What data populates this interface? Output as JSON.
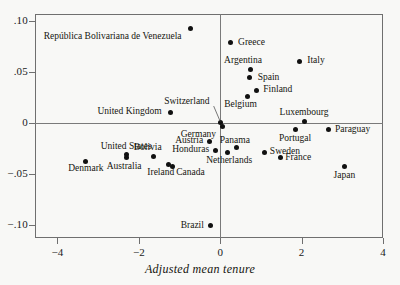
{
  "chart_data": {
    "type": "scatter",
    "title": "",
    "xlabel": "Adjusted mean tenure",
    "ylabel": "",
    "xlim": [
      -4.55,
      4.0
    ],
    "ylim": [
      -0.1125,
      0.1065
    ],
    "grid": false,
    "legend": null,
    "xticks": [
      -4,
      -2,
      0,
      2,
      4
    ],
    "xticklabels": [
      "−4",
      "−2",
      "0",
      "2",
      "4"
    ],
    "yticks": [
      0.1,
      0.05,
      0,
      -0.05,
      -0.1
    ],
    "yticklabels": [
      ".10",
      ".05",
      "0",
      "−.05",
      "−.10"
    ],
    "reference_lines": {
      "horizontal": 0,
      "vertical": 0
    },
    "point_color": "#111111",
    "frame_color": "#6f6f6f",
    "background": "#f8f8f6",
    "points": [
      {
        "label": "República Bolivariana de Venezuela",
        "x": -0.72,
        "y": 0.0925,
        "anchor": "end",
        "lx": -0.95,
        "ly": 0.0845
      },
      {
        "label": "Greece",
        "x": 0.26,
        "y": 0.0785,
        "anchor": "start",
        "lx": 0.44,
        "ly": 0.0785
      },
      {
        "label": "Italy",
        "x": 1.96,
        "y": 0.0605,
        "anchor": "start",
        "lx": 2.14,
        "ly": 0.0605
      },
      {
        "label": "Argentina",
        "x": 0.75,
        "y": 0.0525,
        "anchor": "mid",
        "lx": 0.56,
        "ly": 0.0605
      },
      {
        "label": "Spain",
        "x": 0.73,
        "y": 0.044,
        "anchor": "start",
        "lx": 0.92,
        "ly": 0.044
      },
      {
        "label": "Finland",
        "x": 0.88,
        "y": 0.032,
        "anchor": "start",
        "lx": 1.06,
        "ly": 0.032
      },
      {
        "label": "Belgium",
        "x": 0.66,
        "y": 0.0255,
        "anchor": "mid",
        "lx": 0.5,
        "ly": 0.0175
      },
      {
        "label": "Switzerland",
        "x": 0.01,
        "y": 0.0005,
        "anchor": "end",
        "lx": -0.26,
        "ly": 0.0205
      },
      {
        "label": "United Kingdom",
        "x": -1.23,
        "y": 0.0105,
        "anchor": "end",
        "lx": -1.44,
        "ly": 0.0105
      },
      {
        "label": "Luxembourg",
        "x": 2.06,
        "y": 0.001,
        "anchor": "mid",
        "lx": 2.06,
        "ly": 0.0095
      },
      {
        "label": "Paraguay",
        "x": 2.65,
        "y": -0.0065,
        "anchor": "start",
        "lx": 2.82,
        "ly": -0.0065
      },
      {
        "label": "Germany",
        "x": 0.05,
        "y": -0.0035,
        "anchor": "end",
        "lx": -0.1,
        "ly": -0.0115
      },
      {
        "label": "Portugal",
        "x": 1.84,
        "y": -0.0065,
        "anchor": "mid",
        "lx": 1.84,
        "ly": -0.0155
      },
      {
        "label": "Austria",
        "x": -0.27,
        "y": -0.018,
        "anchor": "end",
        "lx": -0.42,
        "ly": -0.018
      },
      {
        "label": "Bolivia",
        "x": -1.63,
        "y": -0.0325,
        "anchor": "mid",
        "lx": -1.78,
        "ly": -0.0245
      },
      {
        "label": "Panama",
        "x": 0.41,
        "y": -0.0245,
        "anchor": "mid",
        "lx": 0.36,
        "ly": -0.018
      },
      {
        "label": "Sweden",
        "x": 1.1,
        "y": -0.0285,
        "anchor": "start",
        "lx": 1.22,
        "ly": -0.0285
      },
      {
        "label": "United States",
        "x": -2.31,
        "y": -0.0305,
        "anchor": "mid",
        "lx": -2.31,
        "ly": -0.0235
      },
      {
        "label": "Honduras",
        "x": -0.12,
        "y": -0.0265,
        "anchor": "end",
        "lx": -0.27,
        "ly": -0.0265
      },
      {
        "label": "France",
        "x": 1.48,
        "y": -0.034,
        "anchor": "start",
        "lx": 1.6,
        "ly": -0.034
      },
      {
        "label": "Netherlands",
        "x": 0.17,
        "y": -0.029,
        "anchor": "mid",
        "lx": 0.22,
        "ly": -0.037
      },
      {
        "label": "Denmark",
        "x": -3.3,
        "y": -0.0375,
        "anchor": "mid",
        "lx": -3.3,
        "ly": -0.0455
      },
      {
        "label": "Australia",
        "x": -2.31,
        "y": -0.034,
        "anchor": "mid",
        "lx": -2.36,
        "ly": -0.043
      },
      {
        "label": "Ireland",
        "x": -1.28,
        "y": -0.0405,
        "anchor": "mid",
        "lx": -1.46,
        "ly": -0.049
      },
      {
        "label": "Canada",
        "x": -1.18,
        "y": -0.0425,
        "anchor": "start",
        "lx": -1.08,
        "ly": -0.049
      },
      {
        "label": "Japan",
        "x": 3.05,
        "y": -0.043,
        "anchor": "mid",
        "lx": 3.05,
        "ly": -0.052
      },
      {
        "label": "Brazil",
        "x": -0.24,
        "y": -0.1005,
        "anchor": "end",
        "lx": -0.4,
        "ly": -0.1005
      }
    ],
    "leader_lines": [
      {
        "from_label": "Switzerland",
        "x1": -0.16,
        "y1": 0.0165,
        "x2": 0.0,
        "y2": 0.0015
      }
    ]
  }
}
